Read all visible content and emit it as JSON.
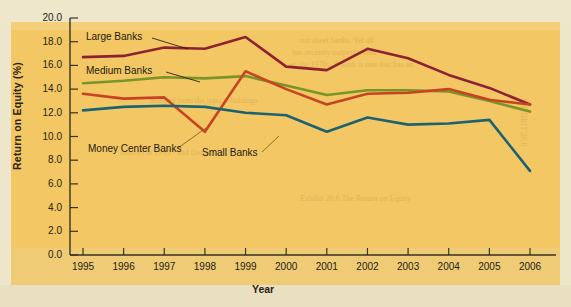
{
  "chart_data": {
    "type": "line",
    "title": "",
    "xlabel": "Year",
    "ylabel": "Return on Equity (%)",
    "categories": [
      "1995",
      "1996",
      "1997",
      "1998",
      "1999",
      "2000",
      "2001",
      "2002",
      "2003",
      "2004",
      "2005",
      "2006"
    ],
    "x": [
      1995,
      1996,
      1997,
      1998,
      1999,
      2000,
      2001,
      2002,
      2003,
      2004,
      2005,
      2006
    ],
    "xlim": [
      1994.6,
      2006.4
    ],
    "ylim": [
      0.0,
      20.0
    ],
    "yticks": [
      "0.0",
      "2.0",
      "4.0",
      "6.0",
      "8.0",
      "10.0",
      "12.0",
      "14.0",
      "16.0",
      "18.0",
      "20.0"
    ],
    "ytick_values": [
      0.0,
      2.0,
      4.0,
      6.0,
      8.0,
      10.0,
      12.0,
      14.0,
      16.0,
      18.0,
      20.0
    ],
    "grid": false,
    "legend_position": "inline-annotations",
    "series": [
      {
        "name": "Large Banks",
        "color": "#8e2233",
        "values": [
          16.7,
          16.8,
          17.5,
          17.4,
          18.4,
          15.9,
          15.6,
          17.4,
          16.6,
          15.2,
          14.1,
          12.7
        ]
      },
      {
        "name": "Medium Banks",
        "color": "#7a9427",
        "values": [
          14.5,
          14.7,
          15.0,
          14.9,
          15.1,
          14.3,
          13.5,
          13.9,
          13.9,
          13.8,
          13.0,
          12.1
        ]
      },
      {
        "name": "Money Center Banks",
        "color": "#c64424",
        "values": [
          13.6,
          13.2,
          13.3,
          10.4,
          15.5,
          14.0,
          12.7,
          13.6,
          13.7,
          14.0,
          13.1,
          12.7
        ]
      },
      {
        "name": "Small Banks",
        "color": "#1d6273",
        "values": [
          12.2,
          12.5,
          12.6,
          12.5,
          12.0,
          11.8,
          10.4,
          11.6,
          11.0,
          11.1,
          11.4,
          7.1
        ]
      }
    ],
    "annotations": [
      {
        "label": "Large Banks",
        "leader_to": "Large Banks series"
      },
      {
        "label": "Medium Banks",
        "leader_to": "Medium Banks series"
      },
      {
        "label": "Money Center Banks",
        "leader_to": "Money Center Banks series"
      },
      {
        "label": "Small Banks",
        "leader_to": "Small Banks series"
      }
    ],
    "plot_background": "#f3c763",
    "page_background": "#eee7cc"
  }
}
